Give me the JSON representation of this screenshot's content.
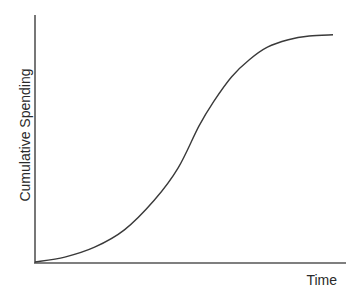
{
  "chart_data": {
    "type": "line",
    "title": "",
    "xlabel": "Time",
    "ylabel": "Cumulative Spending",
    "grid": false,
    "legend": null,
    "ticks": {
      "x": [],
      "y": []
    },
    "xlim": [
      0,
      100
    ],
    "ylim": [
      0,
      100
    ],
    "series": [
      {
        "name": "Cumulative Spending (S-curve)",
        "color": "#3a3a3a",
        "x": [
          0,
          10,
          20,
          30,
          40,
          48,
          55,
          60,
          66,
          72,
          78,
          85,
          92,
          100
        ],
        "y": [
          0,
          2,
          6,
          13,
          25,
          38,
          55,
          65,
          75,
          82,
          87,
          90,
          91.5,
          92
        ]
      }
    ]
  },
  "axes": {
    "color": "#555555"
  }
}
